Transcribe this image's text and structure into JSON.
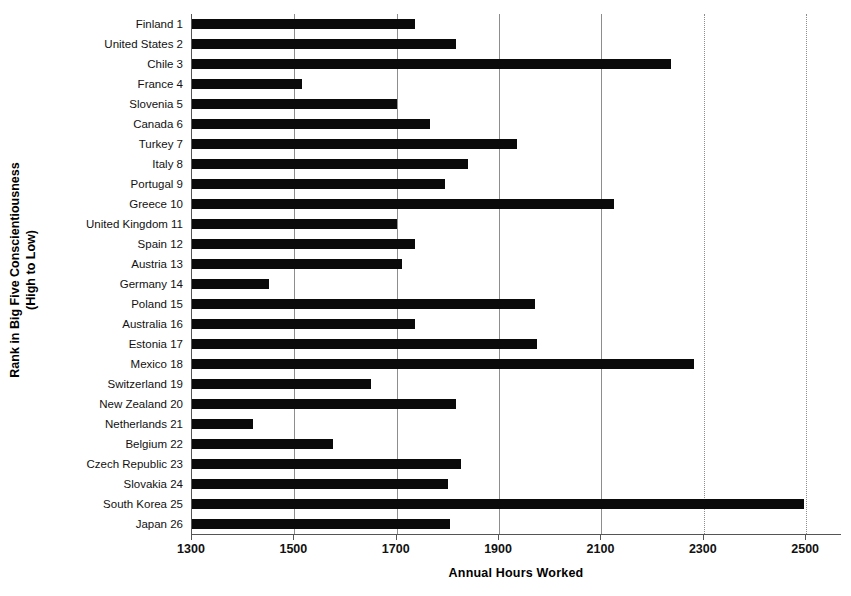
{
  "chart_data": {
    "type": "bar",
    "orientation": "horizontal",
    "title": "",
    "xlabel": "Annual Hours Worked",
    "ylabel": "Rank in Big Five Conscientiousness (High to Low)",
    "ylabel_line1": "Rank in Big Five Conscientiousness",
    "ylabel_line2": "(High to Low)",
    "xlim": [
      1300,
      2570
    ],
    "xticks": [
      1300,
      1500,
      1700,
      1900,
      2100,
      2300,
      2500
    ],
    "xtick_labels": [
      "1300",
      "1500",
      "1700",
      "1900",
      "2100",
      "2300",
      "2500"
    ],
    "grid": "vertical",
    "legend": "none",
    "bar_color": "#0a0a0a",
    "categories": [
      "Finland 1",
      "United States 2",
      "Chile 3",
      "France 4",
      "Slovenia 5",
      "Canada 6",
      "Turkey 7",
      "Italy 8",
      "Portugal 9",
      "Greece 10",
      "United Kingdom 11",
      "Spain 12",
      "Austria 13",
      "Germany 14",
      "Poland 15",
      "Australia 16",
      "Estonia 17",
      "Mexico 18",
      "Switzerland 19",
      "New Zealand 20",
      "Netherlands 21",
      "Belgium 22",
      "Czech Republic 23",
      "Slovakia 24",
      "South Korea 25",
      "Japan 26"
    ],
    "values": [
      1735,
      1815,
      2235,
      1515,
      1700,
      1765,
      1935,
      1840,
      1795,
      2125,
      1700,
      1735,
      1710,
      1450,
      1970,
      1735,
      1975,
      2280,
      1650,
      1815,
      1420,
      1575,
      1825,
      1800,
      2495,
      1805
    ]
  }
}
